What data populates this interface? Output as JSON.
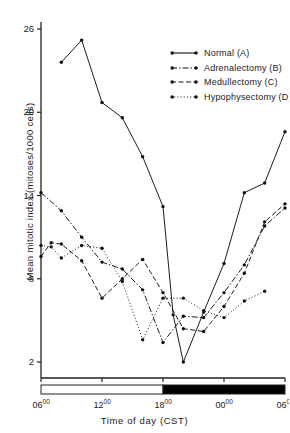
{
  "chart_data": {
    "type": "line",
    "title": "",
    "xlabel": "Time of day (CST)",
    "ylabel": "Mean mitotic index (mitoses/1000 cells)",
    "xlim": [
      6,
      30
    ],
    "ylim": [
      0,
      27.5
    ],
    "yticks": [
      2,
      8,
      14,
      20,
      26
    ],
    "xticks": [
      6,
      12,
      18,
      24,
      30
    ],
    "xtick_labels": [
      "06",
      "12",
      "18",
      "00",
      "06"
    ],
    "xtick_superscript": "00",
    "grid": false,
    "legend_position": "upper right",
    "photoperiod": {
      "light_start": 6,
      "light_end": 18,
      "dark_start": 18,
      "dark_end": 30,
      "light_color": "#ffffff",
      "dark_color": "#000000"
    },
    "series": [
      {
        "name": "Normal (A)",
        "style": "solid",
        "color": "#111111",
        "x": [
          8,
          10,
          12,
          14,
          16,
          18,
          19,
          20,
          22,
          24,
          26,
          28,
          30
        ],
        "y": [
          23.6,
          25.2,
          20.7,
          19.6,
          16.8,
          13.2,
          5.4,
          2.0,
          5.6,
          9.1,
          14.2,
          14.9,
          18.6
        ]
      },
      {
        "name": "Adrenalectomy (B)",
        "style": "dashdot",
        "color": "#111111",
        "x": [
          6,
          8,
          10,
          12,
          14,
          16,
          18,
          20,
          22,
          24,
          26,
          28,
          30
        ],
        "y": [
          14.2,
          12.9,
          11.0,
          9.2,
          8.7,
          7.2,
          3.4,
          5.3,
          5.2,
          7.0,
          9.0,
          11.8,
          13.1
        ]
      },
      {
        "name": "Medullectomy (C)",
        "style": "dashed",
        "color": "#111111",
        "x": [
          6,
          7,
          8,
          10,
          12,
          14,
          16,
          18,
          20,
          22,
          24,
          26,
          28,
          30
        ],
        "y": [
          9.6,
          10.6,
          10.5,
          9.3,
          6.6,
          8.0,
          9.4,
          7.0,
          4.4,
          4.2,
          6.0,
          8.4,
          12.1,
          13.4
        ]
      },
      {
        "name": "Hypophysectomy (D)",
        "style": "dotted",
        "color": "#111111",
        "x": [
          6,
          7,
          8,
          10,
          12,
          14,
          16,
          18,
          20,
          22,
          24,
          26,
          28
        ],
        "y": [
          10.4,
          10.3,
          9.5,
          10.4,
          10.2,
          7.8,
          3.6,
          6.6,
          6.6,
          5.7,
          5.2,
          6.4,
          7.1
        ]
      }
    ]
  },
  "legend": {
    "items": [
      {
        "label": "Normal (A)",
        "style": "solid"
      },
      {
        "label": "Adrenalectomy (B)",
        "style": "dashdot"
      },
      {
        "label": "Medullectomy (C)",
        "style": "dashed"
      },
      {
        "label": "Hypophysectomy (D)",
        "style": "dotted"
      }
    ]
  }
}
